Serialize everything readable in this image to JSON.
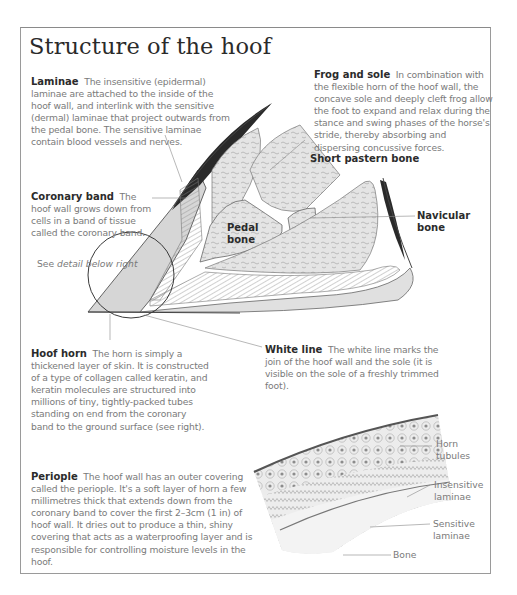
{
  "title": "Structure of the hoof",
  "sections": {
    "laminae": {
      "heading": "Laminae",
      "body": "The insensitive (epidermal) laminae are attached to the inside of the hoof wall, and interlink with the sensitive (dermal) laminae that project outwards from the pedal bone. The sensitive laminae contain blood vessels and nerves."
    },
    "frog_and_sole": {
      "heading": "Frog and sole",
      "body": "In combination with the flexible horn of the hoof wall, the concave sole and deeply cleft frog allow the foot to expand and relax during the stance and swing phases of the horse's stride, thereby absorbing and dispersing concussive forces."
    },
    "coronary_band": {
      "heading": "Coronary band",
      "body": "The hoof wall grows down from cells in a band of tissue called the coronary band."
    },
    "hoof_horn": {
      "heading": "Hoof horn",
      "body": "The horn is simply a thickened layer of skin. It is constructed of a type of collagen called keratin, and keratin molecules are structured into millions of tiny, tightly-packed tubes standing on end from the coronary band to the ground surface (see right)."
    },
    "white_line": {
      "heading": "White line",
      "body": "The white line marks the join of the hoof wall and the sole (it is visible on the sole of a freshly trimmed foot)."
    },
    "periople": {
      "heading": "Periople",
      "body": "The hoof wall has an outer covering called the periople. It's a soft layer of horn a few millimetres thick that extends down from the coronary band to cover the first 2–3cm (1 in) of hoof wall. It dries out to produce a thin, shiny covering that acts as a waterproofing layer and is responsible for controlling moisture levels in the hoof."
    }
  },
  "diagram_labels": {
    "short_pastern_bone": "Short pastern bone",
    "pedal_bone_line1": "Pedal",
    "pedal_bone_line2": "bone",
    "navicular_bone_line1": "Navicular",
    "navicular_bone_line2": "bone",
    "see_detail_prefix": "See ",
    "see_detail_italic": "detail below right"
  },
  "detail_labels": {
    "horn_tubules_line1": "Horn",
    "horn_tubules_line2": "tubules",
    "insensitive_laminae_line1": "Insensitive",
    "insensitive_laminae_line2": "laminae",
    "sensitive_laminae_line1": "Sensitive",
    "sensitive_laminae_line2": "laminae",
    "bone": "Bone"
  }
}
